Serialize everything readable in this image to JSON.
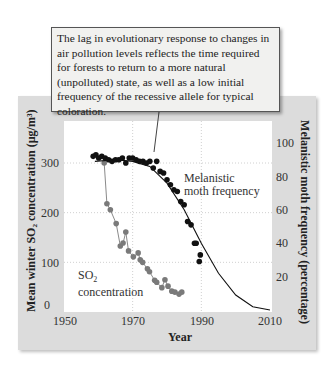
{
  "callout": {
    "text": "The lag in evolutionary response to changes in air pollution levels reflects the time required for forests to return to a more natural (unpolluted) state, as well as a low initial frequency of the recessive allele for typical coloration."
  },
  "axes": {
    "x_label": "Year",
    "x_ticks": [
      "1950",
      "1970",
      "1990",
      "2010"
    ],
    "y_left_label": "Mean winter SO₂ concentration (µg/m³)",
    "y_left_ticks": [
      "0",
      "100",
      "200",
      "300"
    ],
    "y_right_label": "Melanistic moth frequency (percentage)",
    "y_right_ticks": [
      "20",
      "40",
      "60",
      "80",
      "100"
    ]
  },
  "labels": {
    "melanistic": [
      "Melanistic",
      "moth frequency"
    ],
    "so2_line1": "SO",
    "so2_sub": "2",
    "so2_line2": "concentration"
  },
  "colors": {
    "panel": "#dcdcdc",
    "plot_bg": "#ffffff",
    "melanistic_points": "#111111",
    "so2_points": "#7a7a7a",
    "grid": "#d0d0d0"
  },
  "chart_data": {
    "type": "scatter",
    "title": "",
    "xlabel": "Year",
    "ylabel": "Mean winter SO2 concentration (µg/m3)",
    "ylabel_right": "Melanistic moth frequency (percentage)",
    "xlim": [
      1950,
      2010
    ],
    "ylim": [
      0,
      330
    ],
    "ylim_right": [
      0,
      110
    ],
    "grid": true,
    "series": [
      {
        "name": "Melanistic moth frequency",
        "axis": "right",
        "style": "black dots with fitted curve",
        "x": [
          1958.5,
          1959.3,
          1960.1,
          1961,
          1962,
          1963,
          1964,
          1965,
          1966,
          1967,
          1968,
          1969,
          1970,
          1971,
          1972,
          1973,
          1974,
          1975,
          1976,
          1977,
          1978,
          1979,
          1980,
          1981,
          1982,
          1983,
          1984,
          1985,
          1986,
          1987,
          1988,
          1988.5,
          1989.7,
          1989.4
        ],
        "y": [
          92,
          93,
          91,
          92,
          91,
          90,
          89,
          90,
          90,
          91,
          88,
          91,
          91,
          90,
          89,
          89,
          88,
          89,
          85,
          89,
          83,
          82,
          78,
          75,
          72,
          71,
          65,
          63,
          53,
          51,
          40,
          40,
          33,
          29
        ]
      },
      {
        "name": "Melanistic fitted curve",
        "axis": "right",
        "style": "line",
        "x": [
          1959,
          1965,
          1970,
          1975,
          1980,
          1985,
          1990,
          1995,
          2000,
          2005,
          2010
        ],
        "y": [
          89,
          90,
          89,
          86,
          76,
          60,
          40,
          22,
          9,
          2,
          0
        ]
      },
      {
        "name": "SO2 concentration",
        "axis": "left",
        "style": "gray dots connected by lines",
        "x": [
          1961.7,
          1962.5,
          1963.5,
          1965.2,
          1966.4,
          1967.2,
          1968,
          1968.8,
          1970.2,
          1971.6,
          1972.2,
          1972.9,
          1974.3,
          1974.9,
          1976.4,
          1977,
          1978.5,
          1979.4,
          1980.3,
          1981.4,
          1982.3,
          1983.5,
          1984.3
        ],
        "y": [
          300,
          218,
          206,
          178,
          133,
          139,
          161,
          123,
          111,
          119,
          105,
          100,
          87,
          81,
          64,
          60,
          49,
          65,
          52,
          42,
          40,
          36,
          40
        ]
      }
    ],
    "annotations": [
      "Melanistic moth frequency",
      "SO2 concentration"
    ]
  }
}
